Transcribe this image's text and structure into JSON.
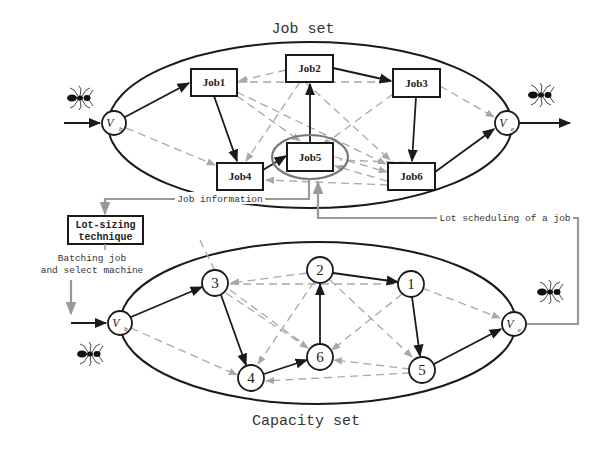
{
  "diagram": {
    "top_set": {
      "title": "Job set",
      "start_node": {
        "label": "V",
        "sub": "b"
      },
      "end_node": {
        "label": "V",
        "sub": "e"
      },
      "nodes": [
        {
          "id": "job1",
          "label": "Job1"
        },
        {
          "id": "job2",
          "label": "Job2"
        },
        {
          "id": "job3",
          "label": "Job3"
        },
        {
          "id": "job4",
          "label": "Job4"
        },
        {
          "id": "job5",
          "label": "Job5",
          "highlighted": true
        },
        {
          "id": "job6",
          "label": "Job6"
        }
      ],
      "solid_path": [
        "Vb",
        "Job1",
        "Job4",
        "Job5",
        "Job2",
        "Job3",
        "Job6",
        "Ve"
      ]
    },
    "bottom_set": {
      "title": "Capacity set",
      "start_node": {
        "label": "V",
        "sub": "b"
      },
      "end_node": {
        "label": "V",
        "sub": "e"
      },
      "nodes": [
        {
          "id": "n1",
          "label": "1"
        },
        {
          "id": "n2",
          "label": "2"
        },
        {
          "id": "n3",
          "label": "3"
        },
        {
          "id": "n4",
          "label": "4"
        },
        {
          "id": "n5",
          "label": "5"
        },
        {
          "id": "n6",
          "label": "6"
        }
      ],
      "solid_path": [
        "Vb",
        "3",
        "4",
        "6",
        "2",
        "1",
        "5",
        "Ve"
      ]
    },
    "annotations": {
      "job_information": "Job information",
      "lot_sizing_line1": "Lot-sizing",
      "lot_sizing_line2": "technique",
      "batching_line1": "Batching job",
      "batching_line2": "and select machine",
      "lot_scheduling": "Lot scheduling of a job"
    },
    "icons": [
      "ant-icon-top-left",
      "ant-icon-top-right",
      "ant-icon-bottom-left",
      "ant-icon-bottom-right"
    ],
    "colors": {
      "solid_edge": "#1a1a1a",
      "dashed_edge": "#a8a8a8",
      "connector": "#999999",
      "background": "#ffffff"
    }
  }
}
